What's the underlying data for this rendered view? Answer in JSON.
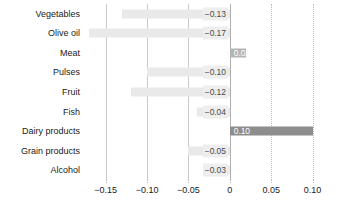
{
  "chart_data": {
    "type": "bar",
    "orientation": "horizontal",
    "title": "",
    "subtitle": "",
    "xlabel": "",
    "ylabel": "",
    "xlim": [
      -0.175,
      0.115
    ],
    "grid": true,
    "legend": null,
    "categories": [
      "Vegetables",
      "Olive oil",
      "Meat",
      "Pulses",
      "Fruit",
      "Fish",
      "Dairy products",
      "Grain products",
      "Alcohol"
    ],
    "values": [
      -0.13,
      -0.17,
      0.02,
      -0.1,
      -0.12,
      -0.04,
      0.1,
      -0.05,
      -0.03
    ],
    "value_labels": [
      "−0.13",
      "−0.17",
      "0.02",
      "−0.10",
      "−0.12",
      "−0.04",
      "0.10",
      "−0.05",
      "−0.03"
    ],
    "xticks": [
      -0.15,
      -0.1,
      -0.05,
      0,
      0.05,
      0.1
    ],
    "xtick_labels": [
      "−0.15",
      "−0.10",
      "−0.05",
      "0",
      "0.05",
      "0.10"
    ],
    "colors": {
      "negative_bar": "#e9e9e9",
      "positive_bar_light": "#b4b4b4",
      "positive_bar_dark": "#8d8d8d",
      "gridline": "#c9c9c9",
      "zero_line": "#b0b0b0",
      "label_text": "#1a1a1a",
      "value_label_text": "#4a4a4a",
      "inside_label_text": "#ffffff"
    }
  }
}
